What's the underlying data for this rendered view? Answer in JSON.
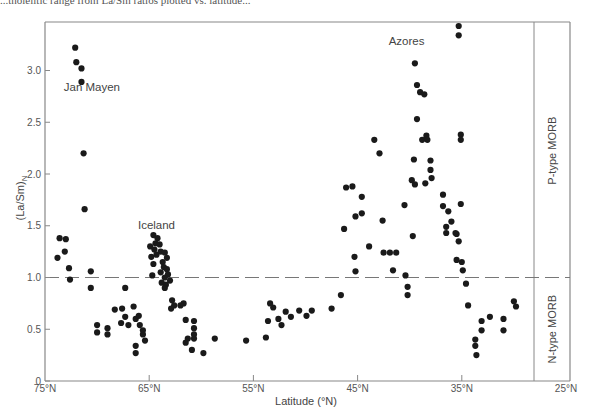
{
  "caption_fragment": "...tholeiitic range from La/Sm ratios plotted vs. latitude...",
  "chart_data": {
    "type": "scatter",
    "title": "",
    "xlabel": "Latitude (°N)",
    "ylabel": "(La/Sm)N",
    "xlim": [
      75,
      25
    ],
    "ylim": [
      0,
      3.5
    ],
    "x_ticks": [
      "75°N",
      "65°N",
      "55°N",
      "45°N",
      "35°N",
      "25°N"
    ],
    "x_tick_values": [
      75,
      65,
      55,
      45,
      35,
      25
    ],
    "y_ticks": [
      "0",
      "0.5",
      "1.0",
      "1.5",
      "2.0",
      "2.5",
      "3.0"
    ],
    "y_tick_values": [
      0,
      0.5,
      1.0,
      1.5,
      2.0,
      2.5,
      3.0
    ],
    "grid": false,
    "reference_line": {
      "y": 1.0,
      "style": "dashed"
    },
    "annotations": [
      {
        "text": "Jan Mayen",
        "x": 70.5,
        "y": 2.8
      },
      {
        "text": "Iceland",
        "x": 64.3,
        "y": 1.47
      },
      {
        "text": "Azores",
        "x": 40.3,
        "y": 3.25
      }
    ],
    "side_panels": [
      {
        "label": "P-type MORB",
        "y_range": [
          1.0,
          3.5
        ]
      },
      {
        "label": "N-type MORB",
        "y_range": [
          0,
          1.0
        ]
      }
    ],
    "series": [
      {
        "name": "MORB samples",
        "points": [
          [
            72.1,
            3.22
          ],
          [
            72.0,
            3.08
          ],
          [
            71.5,
            3.02
          ],
          [
            71.5,
            2.89
          ],
          [
            71.3,
            2.2
          ],
          [
            71.2,
            1.66
          ],
          [
            73.6,
            1.38
          ],
          [
            73.0,
            1.37
          ],
          [
            73.8,
            1.19
          ],
          [
            73.1,
            1.25
          ],
          [
            72.7,
            1.09
          ],
          [
            72.6,
            0.98
          ],
          [
            70.6,
            1.06
          ],
          [
            70.6,
            0.9
          ],
          [
            70.0,
            0.54
          ],
          [
            70.0,
            0.47
          ],
          [
            69.0,
            0.51
          ],
          [
            69.0,
            0.45
          ],
          [
            68.3,
            0.69
          ],
          [
            67.6,
            0.7
          ],
          [
            67.3,
            0.9
          ],
          [
            67.3,
            0.62
          ],
          [
            67.7,
            0.56
          ],
          [
            66.5,
            0.72
          ],
          [
            67.0,
            0.54
          ],
          [
            66.3,
            0.6
          ],
          [
            66.0,
            0.63
          ],
          [
            65.9,
            0.54
          ],
          [
            65.6,
            0.49
          ],
          [
            65.6,
            0.45
          ],
          [
            66.3,
            0.34
          ],
          [
            66.3,
            0.27
          ],
          [
            65.4,
            0.39
          ],
          [
            64.6,
            1.41
          ],
          [
            64.2,
            1.38
          ],
          [
            64.4,
            1.33
          ],
          [
            64.9,
            1.3
          ],
          [
            64.5,
            1.27
          ],
          [
            64.0,
            1.32
          ],
          [
            63.9,
            1.25
          ],
          [
            64.3,
            1.22
          ],
          [
            64.8,
            1.2
          ],
          [
            63.5,
            1.24
          ],
          [
            64.6,
            1.13
          ],
          [
            63.7,
            1.15
          ],
          [
            63.3,
            1.19
          ],
          [
            63.6,
            1.1
          ],
          [
            63.3,
            1.08
          ],
          [
            64.7,
            1.02
          ],
          [
            63.9,
            1.05
          ],
          [
            63.5,
            1.0
          ],
          [
            63.2,
            1.03
          ],
          [
            63.8,
            0.95
          ],
          [
            63.4,
            0.93
          ],
          [
            63.0,
            0.97
          ],
          [
            63.5,
            0.9
          ],
          [
            62.8,
            0.78
          ],
          [
            62.6,
            0.73
          ],
          [
            62.9,
            0.7
          ],
          [
            62.0,
            0.73
          ],
          [
            61.7,
            0.75
          ],
          [
            61.5,
            0.59
          ],
          [
            60.7,
            0.58
          ],
          [
            60.7,
            0.51
          ],
          [
            60.7,
            0.45
          ],
          [
            60.7,
            0.41
          ],
          [
            61.5,
            0.37
          ],
          [
            61.3,
            0.41
          ],
          [
            60.9,
            0.3
          ],
          [
            59.8,
            0.27
          ],
          [
            58.7,
            0.41
          ],
          [
            55.7,
            0.39
          ],
          [
            53.8,
            0.42
          ],
          [
            53.6,
            0.58
          ],
          [
            53.1,
            0.71
          ],
          [
            53.4,
            0.75
          ],
          [
            52.6,
            0.6
          ],
          [
            52.3,
            0.54
          ],
          [
            51.9,
            0.67
          ],
          [
            51.4,
            0.62
          ],
          [
            50.6,
            0.68
          ],
          [
            49.9,
            0.63
          ],
          [
            49.4,
            0.68
          ],
          [
            47.5,
            0.7
          ],
          [
            46.6,
            0.83
          ],
          [
            46.3,
            1.47
          ],
          [
            46.1,
            1.87
          ],
          [
            45.5,
            1.88
          ],
          [
            45.2,
            1.59
          ],
          [
            45.3,
            1.2
          ],
          [
            45.2,
            1.06
          ],
          [
            44.6,
            1.62
          ],
          [
            44.6,
            1.78
          ],
          [
            43.9,
            1.3
          ],
          [
            43.4,
            2.33
          ],
          [
            42.9,
            2.2
          ],
          [
            42.6,
            1.55
          ],
          [
            42.5,
            1.24
          ],
          [
            41.9,
            1.24
          ],
          [
            41.6,
            1.07
          ],
          [
            41.3,
            1.24
          ],
          [
            40.5,
            1.7
          ],
          [
            40.4,
            1.02
          ],
          [
            40.2,
            0.91
          ],
          [
            40.2,
            0.83
          ],
          [
            39.7,
            1.4
          ],
          [
            39.8,
            1.94
          ],
          [
            39.6,
            2.14
          ],
          [
            39.5,
            1.9
          ],
          [
            39.3,
            2.53
          ],
          [
            39.3,
            2.86
          ],
          [
            39.5,
            3.07
          ],
          [
            39.0,
            2.79
          ],
          [
            38.6,
            2.77
          ],
          [
            38.8,
            2.33
          ],
          [
            38.5,
            1.91
          ],
          [
            38.4,
            2.37
          ],
          [
            38.3,
            2.33
          ],
          [
            38.0,
            2.13
          ],
          [
            38.0,
            2.04
          ],
          [
            37.9,
            1.96
          ],
          [
            36.8,
            1.8
          ],
          [
            36.8,
            1.69
          ],
          [
            36.5,
            1.49
          ],
          [
            36.5,
            1.43
          ],
          [
            36.3,
            1.64
          ],
          [
            36.0,
            1.54
          ],
          [
            35.5,
            1.42
          ],
          [
            35.6,
            1.43
          ],
          [
            35.5,
            1.17
          ],
          [
            35.3,
            1.35
          ],
          [
            35.0,
            1.15
          ],
          [
            34.9,
            1.07
          ],
          [
            35.3,
            3.43
          ],
          [
            35.3,
            3.34
          ],
          [
            35.1,
            2.38
          ],
          [
            35.1,
            2.33
          ],
          [
            35.1,
            1.71
          ],
          [
            34.6,
            0.94
          ],
          [
            34.4,
            0.73
          ],
          [
            33.7,
            0.4
          ],
          [
            33.7,
            0.34
          ],
          [
            33.6,
            0.25
          ],
          [
            33.1,
            0.58
          ],
          [
            33.1,
            0.49
          ],
          [
            32.3,
            0.62
          ],
          [
            31.0,
            0.6
          ],
          [
            31.0,
            0.49
          ],
          [
            30.0,
            0.77
          ],
          [
            29.8,
            0.72
          ]
        ]
      }
    ]
  }
}
